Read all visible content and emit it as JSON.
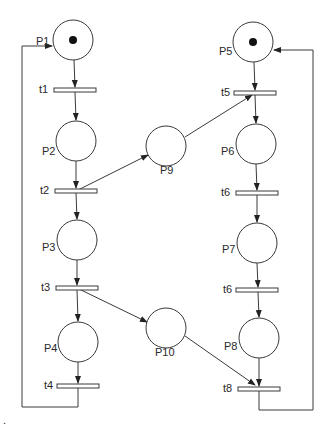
{
  "diagram": {
    "type": "petri-net",
    "colors": {
      "stroke": "#3a3a3a",
      "token": "#111111",
      "background": "#ffffff"
    },
    "places": [
      {
        "id": "P1",
        "label": "P1",
        "cx": 73,
        "cy": 40,
        "r": 20,
        "tokens": 1,
        "label_x": 38,
        "label_y": 44
      },
      {
        "id": "P2",
        "label": "P2",
        "cx": 76,
        "cy": 141,
        "r": 20,
        "tokens": 0,
        "label_x": 42,
        "label_y": 155
      },
      {
        "id": "P3",
        "label": "P3",
        "cx": 77,
        "cy": 240,
        "r": 20,
        "tokens": 0,
        "label_x": 42,
        "label_y": 251
      },
      {
        "id": "P4",
        "label": "P4",
        "cx": 78,
        "cy": 342,
        "r": 20,
        "tokens": 0,
        "label_x": 44,
        "label_y": 352
      },
      {
        "id": "P5",
        "label": "P5",
        "cx": 253,
        "cy": 42,
        "r": 20,
        "tokens": 1,
        "label_x": 219,
        "label_y": 55
      },
      {
        "id": "P6",
        "label": "P6",
        "cx": 256,
        "cy": 144,
        "r": 20,
        "tokens": 0,
        "label_x": 221,
        "label_y": 155
      },
      {
        "id": "P7",
        "label": "P7",
        "cx": 257,
        "cy": 243,
        "r": 20,
        "tokens": 0,
        "label_x": 222,
        "label_y": 253
      },
      {
        "id": "P8",
        "label": "P8",
        "cx": 259,
        "cy": 338,
        "r": 20,
        "tokens": 0,
        "label_x": 224,
        "label_y": 350
      },
      {
        "id": "P9",
        "label": "P9",
        "cx": 166,
        "cy": 146,
        "r": 20,
        "tokens": 0,
        "label_x": 160,
        "label_y": 174
      },
      {
        "id": "P10",
        "label": "P10",
        "cx": 166,
        "cy": 328,
        "r": 20,
        "tokens": 0,
        "label_x": 155,
        "label_y": 356
      }
    ],
    "transitions": [
      {
        "id": "t1",
        "label": "t1",
        "x": 54,
        "y": 88,
        "w": 42,
        "h": 4,
        "label_x": 39,
        "label_y": 93
      },
      {
        "id": "t2",
        "label": "t2",
        "x": 55,
        "y": 189,
        "w": 42,
        "h": 4,
        "label_x": 40,
        "label_y": 194
      },
      {
        "id": "t3",
        "label": "t3",
        "x": 56,
        "y": 286,
        "w": 42,
        "h": 4,
        "label_x": 41,
        "label_y": 291
      },
      {
        "id": "t4",
        "label": "t4",
        "x": 57,
        "y": 384,
        "w": 42,
        "h": 4,
        "label_x": 44,
        "label_y": 389
      },
      {
        "id": "t5",
        "label": "t5",
        "x": 234,
        "y": 91,
        "w": 42,
        "h": 4,
        "label_x": 221,
        "label_y": 96
      },
      {
        "id": "t6a",
        "label": "t6",
        "x": 236,
        "y": 191,
        "w": 42,
        "h": 4,
        "label_x": 221,
        "label_y": 196
      },
      {
        "id": "t6b",
        "label": "t6",
        "x": 236,
        "y": 288,
        "w": 42,
        "h": 4,
        "label_x": 223,
        "label_y": 293
      },
      {
        "id": "t8",
        "label": "t8",
        "x": 238,
        "y": 387,
        "w": 42,
        "h": 4,
        "label_x": 223,
        "label_y": 392
      }
    ],
    "arcs": [
      {
        "from": "P1",
        "to": "t1"
      },
      {
        "from": "t1",
        "to": "P2"
      },
      {
        "from": "P2",
        "to": "t2"
      },
      {
        "from": "t2",
        "to": "P3"
      },
      {
        "from": "t2",
        "to": "P9"
      },
      {
        "from": "P3",
        "to": "t3"
      },
      {
        "from": "t3",
        "to": "P4"
      },
      {
        "from": "t3",
        "to": "P10"
      },
      {
        "from": "P4",
        "to": "t4"
      },
      {
        "from": "t4",
        "to": "P1",
        "routing": "left-loop"
      },
      {
        "from": "P5",
        "to": "t5"
      },
      {
        "from": "P9",
        "to": "t5"
      },
      {
        "from": "t5",
        "to": "P6"
      },
      {
        "from": "P6",
        "to": "t6a"
      },
      {
        "from": "t6a",
        "to": "P7"
      },
      {
        "from": "P7",
        "to": "t6b"
      },
      {
        "from": "t6b",
        "to": "P8"
      },
      {
        "from": "P8",
        "to": "t8"
      },
      {
        "from": "P10",
        "to": "t8"
      },
      {
        "from": "t8",
        "to": "P5",
        "routing": "right-loop"
      }
    ],
    "footnote": "."
  }
}
